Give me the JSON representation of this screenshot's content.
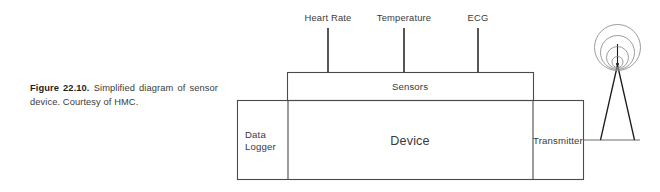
{
  "figure": {
    "caption_label": "Figure 22.10.",
    "caption_text": "Simplified diagram of sensor device. Courtesy of HMC."
  },
  "diagram": {
    "sensor_inputs": [
      {
        "label": "Heart Rate",
        "x": 328
      },
      {
        "label": "Temperature",
        "x": 404
      },
      {
        "label": "ECG",
        "x": 478
      }
    ],
    "sensors_block": {
      "label": "Sensors"
    },
    "device_block": {
      "label": "Device"
    },
    "data_logger_block": {
      "label": "Data Logger",
      "line1": "Data",
      "line2": "Logger"
    },
    "transmitter_block": {
      "label": "Transmitter"
    },
    "antenna": {
      "label": "antenna-tower",
      "wave_count": 4
    },
    "colors": {
      "box_stroke": "#4a4a4a",
      "stem_stroke": "#2b2b2b",
      "wave_stroke": "#8a8a8a",
      "text": "#3a3a3a",
      "background": "#ffffff"
    }
  }
}
